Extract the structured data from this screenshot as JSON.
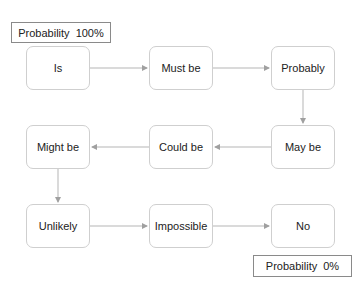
{
  "diagram": {
    "labels": {
      "top": "Probability  100%",
      "bottom": "Probability  0%"
    },
    "nodes": [
      {
        "id": "is",
        "label": "Is",
        "x": 26,
        "y": 46
      },
      {
        "id": "must_be",
        "label": "Must be",
        "x": 149,
        "y": 46
      },
      {
        "id": "probably",
        "label": "Probably",
        "x": 271,
        "y": 46
      },
      {
        "id": "may_be",
        "label": "May be",
        "x": 271,
        "y": 125
      },
      {
        "id": "could_be",
        "label": "Could be",
        "x": 149,
        "y": 125
      },
      {
        "id": "might_be",
        "label": "Might be",
        "x": 26,
        "y": 125
      },
      {
        "id": "unlikely",
        "label": "Unlikely",
        "x": 26,
        "y": 204
      },
      {
        "id": "impossible",
        "label": "Impossible",
        "x": 149,
        "y": 204
      },
      {
        "id": "no",
        "label": "No",
        "x": 271,
        "y": 204
      }
    ],
    "edges": [
      [
        "is",
        "must_be"
      ],
      [
        "must_be",
        "probably"
      ],
      [
        "probably",
        "may_be"
      ],
      [
        "may_be",
        "could_be"
      ],
      [
        "could_be",
        "might_be"
      ],
      [
        "might_be",
        "unlikely"
      ],
      [
        "unlikely",
        "impossible"
      ],
      [
        "impossible",
        "no"
      ]
    ],
    "colors": {
      "edge": "#a8a8a8",
      "node_border": "#cfcfcf",
      "label_border": "#8a8a8a"
    }
  }
}
